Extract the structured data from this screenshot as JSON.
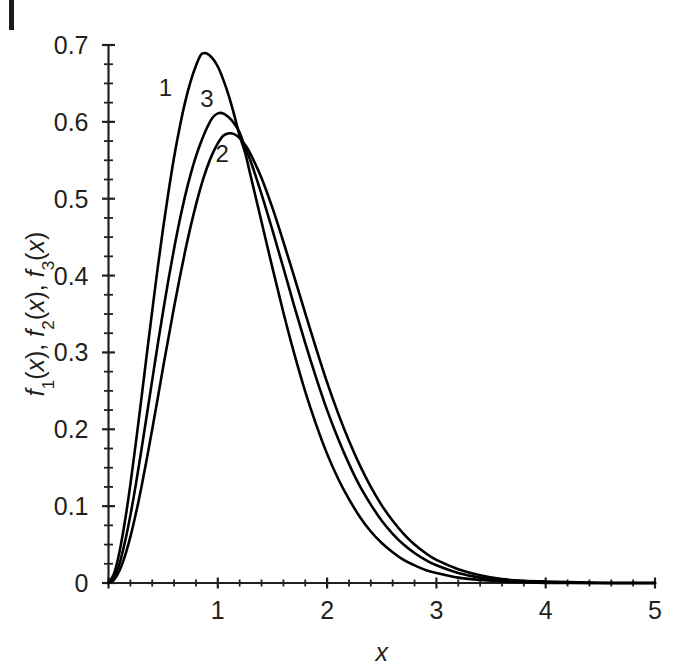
{
  "figure": {
    "background_color": "#ffffff",
    "ink_color": "#231f20",
    "page_edge_mark": "page-edge-rule"
  },
  "chart_data": {
    "type": "line",
    "title": "",
    "xlabel": "x",
    "ylabel": "f₁(x), f₂(x), f₃(x)",
    "ylabel_parts": [
      {
        "base": "f",
        "sub": "1",
        "tail": "(x),"
      },
      {
        "base": "f",
        "sub": "2",
        "tail": "(x),"
      },
      {
        "base": "f",
        "sub": "3",
        "tail": "(x)"
      }
    ],
    "xlim": [
      0,
      5
    ],
    "ylim": [
      0,
      0.7
    ],
    "grid": false,
    "legend_position": "inline-curve-labels",
    "x_major_ticks": [
      0,
      1,
      2,
      3,
      4,
      5
    ],
    "x_major_ticklabels": [
      "0",
      "1",
      "2",
      "3",
      "4",
      "5"
    ],
    "x_minor_step": 0.2,
    "y_major_ticks": [
      0,
      0.1,
      0.2,
      0.3,
      0.4,
      0.5,
      0.6,
      0.7
    ],
    "y_major_ticklabels": [
      "0",
      "0.1",
      "0.2",
      "0.3",
      "0.4",
      "0.5",
      "0.6",
      "0.7"
    ],
    "y_minor_step": 0.025,
    "annotations": [
      {
        "text": "1",
        "x": 0.52,
        "y": 0.634
      },
      {
        "text": "3",
        "x": 0.9,
        "y": 0.619
      },
      {
        "text": "2",
        "x": 1.04,
        "y": 0.548
      }
    ],
    "series": [
      {
        "name": "1",
        "label": "1",
        "peak_x": 0.85,
        "peak_y": 0.69,
        "points": [
          [
            0.0,
            0.0
          ],
          [
            0.05,
            0.012
          ],
          [
            0.1,
            0.04
          ],
          [
            0.15,
            0.08
          ],
          [
            0.2,
            0.128
          ],
          [
            0.25,
            0.182
          ],
          [
            0.3,
            0.239
          ],
          [
            0.35,
            0.297
          ],
          [
            0.4,
            0.354
          ],
          [
            0.45,
            0.41
          ],
          [
            0.5,
            0.462
          ],
          [
            0.55,
            0.51
          ],
          [
            0.6,
            0.554
          ],
          [
            0.65,
            0.592
          ],
          [
            0.7,
            0.625
          ],
          [
            0.75,
            0.652
          ],
          [
            0.8,
            0.673
          ],
          [
            0.85,
            0.688
          ],
          [
            0.9,
            0.689
          ],
          [
            0.95,
            0.683
          ],
          [
            1.0,
            0.672
          ],
          [
            1.05,
            0.655
          ],
          [
            1.1,
            0.634
          ],
          [
            1.15,
            0.609
          ],
          [
            1.2,
            0.582
          ],
          [
            1.25,
            0.56
          ],
          [
            1.3,
            0.53
          ],
          [
            1.4,
            0.47
          ],
          [
            1.5,
            0.41
          ],
          [
            1.6,
            0.352
          ],
          [
            1.7,
            0.298
          ],
          [
            1.8,
            0.249
          ],
          [
            1.9,
            0.206
          ],
          [
            2.0,
            0.168
          ],
          [
            2.1,
            0.136
          ],
          [
            2.2,
            0.109
          ],
          [
            2.3,
            0.086
          ],
          [
            2.4,
            0.067
          ],
          [
            2.5,
            0.052
          ],
          [
            2.6,
            0.04
          ],
          [
            2.7,
            0.03
          ],
          [
            2.8,
            0.023
          ],
          [
            2.9,
            0.017
          ],
          [
            3.0,
            0.013
          ],
          [
            3.2,
            0.007
          ],
          [
            3.4,
            0.004
          ],
          [
            3.6,
            0.002
          ],
          [
            3.8,
            0.001
          ],
          [
            4.0,
            0.0
          ],
          [
            4.5,
            0.0
          ],
          [
            5.0,
            0.0
          ]
        ]
      },
      {
        "name": "2",
        "label": "2",
        "peak_x": 1.07,
        "peak_y": 0.585,
        "points": [
          [
            0.0,
            0.0
          ],
          [
            0.05,
            0.004
          ],
          [
            0.1,
            0.016
          ],
          [
            0.15,
            0.035
          ],
          [
            0.2,
            0.06
          ],
          [
            0.25,
            0.09
          ],
          [
            0.3,
            0.124
          ],
          [
            0.35,
            0.161
          ],
          [
            0.4,
            0.2
          ],
          [
            0.45,
            0.24
          ],
          [
            0.5,
            0.281
          ],
          [
            0.55,
            0.32
          ],
          [
            0.6,
            0.359
          ],
          [
            0.65,
            0.396
          ],
          [
            0.7,
            0.431
          ],
          [
            0.75,
            0.463
          ],
          [
            0.8,
            0.492
          ],
          [
            0.85,
            0.518
          ],
          [
            0.9,
            0.54
          ],
          [
            0.95,
            0.558
          ],
          [
            1.0,
            0.572
          ],
          [
            1.05,
            0.582
          ],
          [
            1.1,
            0.585
          ],
          [
            1.15,
            0.584
          ],
          [
            1.2,
            0.579
          ],
          [
            1.25,
            0.57
          ],
          [
            1.3,
            0.558
          ],
          [
            1.4,
            0.527
          ],
          [
            1.5,
            0.488
          ],
          [
            1.6,
            0.444
          ],
          [
            1.7,
            0.398
          ],
          [
            1.8,
            0.351
          ],
          [
            1.9,
            0.305
          ],
          [
            2.0,
            0.261
          ],
          [
            2.1,
            0.221
          ],
          [
            2.2,
            0.185
          ],
          [
            2.3,
            0.153
          ],
          [
            2.4,
            0.125
          ],
          [
            2.5,
            0.101
          ],
          [
            2.6,
            0.081
          ],
          [
            2.7,
            0.064
          ],
          [
            2.8,
            0.05
          ],
          [
            2.9,
            0.039
          ],
          [
            3.0,
            0.03
          ],
          [
            3.2,
            0.018
          ],
          [
            3.4,
            0.01
          ],
          [
            3.6,
            0.005
          ],
          [
            3.8,
            0.003
          ],
          [
            4.0,
            0.002
          ],
          [
            4.3,
            0.001
          ],
          [
            4.6,
            0.0
          ],
          [
            5.0,
            0.0
          ]
        ]
      },
      {
        "name": "3",
        "label": "3",
        "peak_x": 0.97,
        "peak_y": 0.612,
        "points": [
          [
            0.0,
            0.0
          ],
          [
            0.05,
            0.007
          ],
          [
            0.1,
            0.025
          ],
          [
            0.15,
            0.053
          ],
          [
            0.2,
            0.088
          ],
          [
            0.25,
            0.128
          ],
          [
            0.3,
            0.172
          ],
          [
            0.35,
            0.218
          ],
          [
            0.4,
            0.264
          ],
          [
            0.45,
            0.31
          ],
          [
            0.5,
            0.354
          ],
          [
            0.55,
            0.396
          ],
          [
            0.6,
            0.435
          ],
          [
            0.65,
            0.471
          ],
          [
            0.7,
            0.503
          ],
          [
            0.75,
            0.531
          ],
          [
            0.8,
            0.555
          ],
          [
            0.85,
            0.575
          ],
          [
            0.9,
            0.592
          ],
          [
            0.95,
            0.605
          ],
          [
            1.0,
            0.611
          ],
          [
            1.05,
            0.611
          ],
          [
            1.1,
            0.606
          ],
          [
            1.15,
            0.598
          ],
          [
            1.2,
            0.586
          ],
          [
            1.25,
            0.566
          ],
          [
            1.3,
            0.549
          ],
          [
            1.4,
            0.506
          ],
          [
            1.5,
            0.459
          ],
          [
            1.6,
            0.41
          ],
          [
            1.7,
            0.36
          ],
          [
            1.8,
            0.312
          ],
          [
            1.9,
            0.267
          ],
          [
            2.0,
            0.225
          ],
          [
            2.1,
            0.188
          ],
          [
            2.2,
            0.155
          ],
          [
            2.3,
            0.126
          ],
          [
            2.4,
            0.102
          ],
          [
            2.5,
            0.081
          ],
          [
            2.6,
            0.064
          ],
          [
            2.7,
            0.05
          ],
          [
            2.8,
            0.039
          ],
          [
            2.9,
            0.03
          ],
          [
            3.0,
            0.023
          ],
          [
            3.2,
            0.013
          ],
          [
            3.4,
            0.007
          ],
          [
            3.6,
            0.004
          ],
          [
            3.8,
            0.002
          ],
          [
            4.0,
            0.001
          ],
          [
            4.4,
            0.0
          ],
          [
            5.0,
            0.0
          ]
        ]
      }
    ]
  }
}
